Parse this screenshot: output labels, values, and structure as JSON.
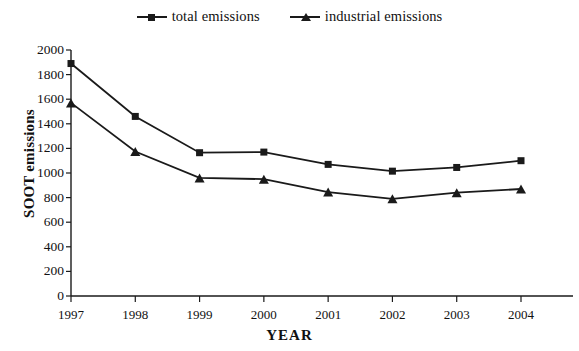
{
  "chart_data": {
    "type": "line",
    "title": "",
    "xlabel": "YEAR",
    "ylabel": "SOOT emissions",
    "categories": [
      "1997",
      "1998",
      "1999",
      "2000",
      "2001",
      "2002",
      "2003",
      "2004"
    ],
    "series": [
      {
        "name": "total emissions",
        "marker": "square",
        "color": "#1a1a1a",
        "values": [
          1890,
          1460,
          1165,
          1170,
          1070,
          1015,
          1045,
          1100
        ]
      },
      {
        "name": "industrial emissions",
        "marker": "triangle",
        "color": "#1a1a1a",
        "values": [
          1570,
          1175,
          960,
          950,
          845,
          790,
          840,
          870
        ]
      }
    ],
    "ylim": [
      0,
      2000
    ],
    "yticks": [
      0,
      200,
      400,
      600,
      800,
      1000,
      1200,
      1400,
      1600,
      1800,
      2000
    ],
    "ytick_labels": [
      "0",
      "200",
      "400",
      "600",
      "800",
      "1000",
      "1200",
      "1400",
      "1600",
      "1800",
      "2000"
    ],
    "grid": false,
    "legend_position": "top-center"
  },
  "legend": {
    "items": [
      {
        "label": "total emissions",
        "marker": "square-marker-icon"
      },
      {
        "label": "industrial emissions",
        "marker": "triangle-marker-icon"
      }
    ]
  },
  "axes": {
    "y_title": "SOOT emissions",
    "x_title": "YEAR"
  }
}
